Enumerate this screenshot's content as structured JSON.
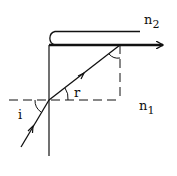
{
  "diagram": {
    "type": "refraction-total-internal-reflection",
    "labels": {
      "medium_top": "n",
      "medium_top_sub": "2",
      "medium_bottom": "n",
      "medium_bottom_sub": "1",
      "angle_incidence": "i",
      "angle_refraction": "r"
    },
    "colors": {
      "stroke": "#111111",
      "background": "#ffffff"
    }
  }
}
